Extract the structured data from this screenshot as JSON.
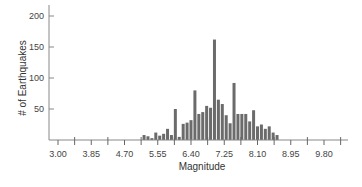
{
  "chart_data": {
    "type": "bar",
    "title": "",
    "xlabel": "Magnitude",
    "ylabel": "# of Earthquakes",
    "x_ticks": [
      "3.00",
      "3.85",
      "4.70",
      "5.55",
      "6.40",
      "7.25",
      "8.10",
      "8.95",
      "9.80"
    ],
    "y_ticks": [
      "50",
      "100",
      "150",
      "200"
    ],
    "ylim": [
      0,
      210
    ],
    "xlim": [
      2.85,
      10.3
    ],
    "grid": false,
    "legend": "none",
    "bar_color": "#6b6b6b",
    "x": [
      5.2,
      5.3,
      5.4,
      5.5,
      5.6,
      5.7,
      5.8,
      5.9,
      6.0,
      6.1,
      6.2,
      6.3,
      6.4,
      6.5,
      6.6,
      6.7,
      6.8,
      6.9,
      7.0,
      7.1,
      7.2,
      7.3,
      7.4,
      7.5,
      7.6,
      7.7,
      7.8,
      7.9,
      8.0,
      8.1,
      8.2,
      8.3,
      8.4,
      8.5,
      8.6
    ],
    "values": [
      8,
      6,
      3,
      12,
      7,
      10,
      18,
      8,
      50,
      5,
      26,
      28,
      32,
      80,
      42,
      45,
      55,
      52,
      162,
      65,
      58,
      40,
      27,
      92,
      42,
      42,
      42,
      30,
      48,
      22,
      25,
      18,
      22,
      12,
      8
    ]
  },
  "axes": {
    "x_title": "Magnitude",
    "y_title": "# of Earthquakes"
  }
}
